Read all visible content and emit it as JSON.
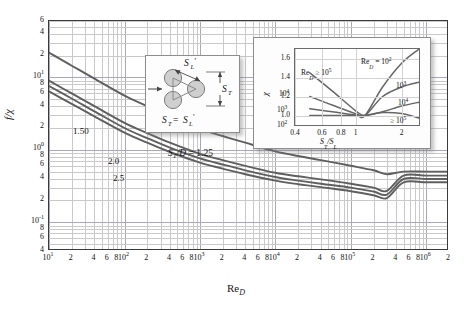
{
  "figure": {
    "y_axis_title": "f/χ",
    "x_axis_title_prefix": "Re",
    "x_axis_title_sub": "D"
  },
  "main_axis": {
    "x_ticks": [
      {
        "label": "10",
        "sup": "1",
        "value": 10
      },
      {
        "label": "2",
        "sup": "",
        "value": 20
      },
      {
        "label": "4",
        "sup": "",
        "value": 40
      },
      {
        "label": "6",
        "sup": "",
        "value": 60
      },
      {
        "label": "8",
        "sup": "",
        "value": 80
      },
      {
        "label": "10",
        "sup": "2",
        "value": 100
      },
      {
        "label": "2",
        "sup": "",
        "value": 200
      },
      {
        "label": "4",
        "sup": "",
        "value": 400
      },
      {
        "label": "6",
        "sup": "",
        "value": 600
      },
      {
        "label": "8",
        "sup": "",
        "value": 800
      },
      {
        "label": "10",
        "sup": "3",
        "value": 1000
      },
      {
        "label": "2",
        "sup": "",
        "value": 2000
      },
      {
        "label": "4",
        "sup": "",
        "value": 4000
      },
      {
        "label": "6",
        "sup": "",
        "value": 6000
      },
      {
        "label": "8",
        "sup": "",
        "value": 8000
      },
      {
        "label": "10",
        "sup": "4",
        "value": 10000
      },
      {
        "label": "2",
        "sup": "",
        "value": 20000
      },
      {
        "label": "4",
        "sup": "",
        "value": 40000
      },
      {
        "label": "6",
        "sup": "",
        "value": 60000
      },
      {
        "label": "8",
        "sup": "",
        "value": 80000
      },
      {
        "label": "10",
        "sup": "5",
        "value": 100000
      },
      {
        "label": "2",
        "sup": "",
        "value": 200000
      },
      {
        "label": "4",
        "sup": "",
        "value": 400000
      },
      {
        "label": "6",
        "sup": "",
        "value": 600000
      },
      {
        "label": "8",
        "sup": "",
        "value": 800000
      },
      {
        "label": "10",
        "sup": "6",
        "value": 1000000
      },
      {
        "label": "2",
        "sup": "",
        "value": 2000000
      }
    ],
    "y_ticks": [
      {
        "label": "6",
        "sup": "",
        "value": 60
      },
      {
        "label": "4",
        "sup": "",
        "value": 40
      },
      {
        "label": "2",
        "sup": "",
        "value": 20
      },
      {
        "label": "10",
        "sup": "1",
        "value": 10
      },
      {
        "label": "8",
        "sup": "",
        "value": 8
      },
      {
        "label": "6",
        "sup": "",
        "value": 6
      },
      {
        "label": "4",
        "sup": "",
        "value": 4
      },
      {
        "label": "2",
        "sup": "",
        "value": 2
      },
      {
        "label": "10",
        "sup": "0",
        "value": 1
      },
      {
        "label": "8",
        "sup": "",
        "value": 0.8
      },
      {
        "label": "6",
        "sup": "",
        "value": 0.6
      },
      {
        "label": "4",
        "sup": "",
        "value": 0.4
      },
      {
        "label": "2",
        "sup": "",
        "value": 0.2
      },
      {
        "label": "10",
        "sup": "-1",
        "value": 0.1
      },
      {
        "label": "8",
        "sup": "",
        "value": 0.08
      },
      {
        "label": "6",
        "sup": "",
        "value": 0.06
      },
      {
        "label": "4",
        "sup": "",
        "value": 0.04
      }
    ]
  },
  "curve_labels": [
    {
      "name": "curve-label-150",
      "text": "1.50",
      "left": 73,
      "top": 126
    },
    {
      "name": "curve-label-20",
      "text": "2.0",
      "left": 108,
      "top": 156
    },
    {
      "name": "curve-label-25",
      "text": "2.5",
      "left": 113,
      "top": 173
    }
  ],
  "ratio_annotation": {
    "name": "st-over-d-annotation",
    "text_html": "S_T/D = 1.25",
    "left": 168,
    "top": 148
  },
  "tube_diagram": {
    "label_sl": "Sₗ'",
    "label_st": "S_T",
    "label_equation": "S_T = S_L'"
  },
  "inset": {
    "y_axis_title": "χ",
    "x_axis_title_prefix": "S",
    "x_axis_title_sub1": "T",
    "x_axis_title_mid": "/S",
    "x_axis_title_sub2": "L",
    "y_ticks": [
      {
        "label": "1.6",
        "value": 1.6
      },
      {
        "label": "1.4",
        "value": 1.4
      },
      {
        "label": "1.2",
        "value": 1.2
      },
      {
        "label": "1.0",
        "value": 1.0
      }
    ],
    "x_ticks": [
      {
        "label": "0.4",
        "value": 0.4
      },
      {
        "label": "0.6",
        "value": 0.6
      },
      {
        "label": "0.8",
        "value": 0.8
      },
      {
        "label": "1",
        "value": 1.0
      },
      {
        "label": "2",
        "value": 2.0
      }
    ],
    "left_labels": [
      {
        "name": "inset-label-re-ge-1e5-left",
        "text": "Re",
        "sub": "D",
        "rest": " ≥ 10",
        "sup": "5",
        "left": 44,
        "top": 20
      },
      {
        "name": "inset-label-1e4-left",
        "text": "10",
        "sub": "",
        "rest": "",
        "sup": "4",
        "left": 22,
        "top": 41
      },
      {
        "name": "inset-label-1e3-left",
        "text": "10",
        "sub": "",
        "rest": "",
        "sup": "3",
        "left": 20,
        "top": 57
      },
      {
        "name": "inset-label-1e2-left",
        "text": "10",
        "sub": "",
        "rest": "",
        "sup": "2",
        "left": 20,
        "top": 72
      }
    ],
    "right_labels": [
      {
        "name": "inset-label-re-1e2-right",
        "text": "Re",
        "sub": "D",
        "rest": " = 10",
        "sup": "2",
        "left": 104,
        "top": 9
      },
      {
        "name": "inset-label-1e3-right",
        "text": "10",
        "sub": "",
        "rest": "",
        "sup": "3",
        "left": 139,
        "top": 33
      },
      {
        "name": "inset-label-1e4-right",
        "text": "10",
        "sub": "",
        "rest": "",
        "sup": "4",
        "left": 141,
        "top": 50
      },
      {
        "name": "inset-label-ge-1e5-right",
        "text": "≥ 10",
        "sub": "",
        "rest": "",
        "sup": "5",
        "left": 133,
        "top": 68
      }
    ]
  },
  "chart_data": {
    "type": "line",
    "xlabel": "Re_D",
    "ylabel": "f/χ",
    "xscale": "log",
    "yscale": "log",
    "xlim": [
      10,
      2000000
    ],
    "ylim": [
      0.04,
      60
    ],
    "grid": true,
    "legend": "inline curve labels",
    "series": [
      {
        "name": "S_T/D = 1.25",
        "label": "1.25",
        "x": [
          10,
          20,
          40,
          100,
          200,
          400,
          1000,
          2000,
          4000,
          10000,
          20000,
          40000,
          100000,
          200000,
          300000,
          500000,
          1000000,
          2000000
        ],
        "y": [
          22,
          14.5,
          9.6,
          5.6,
          4.0,
          2.85,
          1.95,
          1.55,
          1.25,
          0.95,
          0.82,
          0.72,
          0.6,
          0.52,
          0.46,
          0.5,
          0.5,
          0.5
        ]
      },
      {
        "name": "S_T/D = 1.50",
        "label": "1.50",
        "x": [
          10,
          20,
          40,
          100,
          200,
          400,
          1000,
          2000,
          4000,
          10000,
          20000,
          40000,
          100000,
          200000,
          300000,
          500000,
          1000000,
          2000000
        ],
        "y": [
          9.0,
          6.0,
          4.0,
          2.35,
          1.7,
          1.25,
          0.88,
          0.72,
          0.6,
          0.48,
          0.43,
          0.39,
          0.34,
          0.3,
          0.27,
          0.44,
          0.44,
          0.44
        ]
      },
      {
        "name": "S_T/D = 2.0",
        "label": "2.0",
        "x": [
          10,
          20,
          40,
          100,
          200,
          400,
          1000,
          2000,
          4000,
          10000,
          20000,
          40000,
          100000,
          200000,
          300000,
          500000,
          1000000,
          2000000
        ],
        "y": [
          7.6,
          5.1,
          3.4,
          2.0,
          1.45,
          1.07,
          0.76,
          0.625,
          0.52,
          0.42,
          0.375,
          0.34,
          0.3,
          0.265,
          0.24,
          0.395,
          0.395,
          0.395
        ]
      },
      {
        "name": "S_T/D = 2.5",
        "label": "2.5",
        "x": [
          10,
          20,
          40,
          100,
          200,
          400,
          1000,
          2000,
          4000,
          10000,
          20000,
          40000,
          100000,
          200000,
          300000,
          500000,
          1000000,
          2000000
        ],
        "y": [
          6.4,
          4.3,
          2.9,
          1.72,
          1.25,
          0.93,
          0.665,
          0.55,
          0.46,
          0.375,
          0.335,
          0.305,
          0.268,
          0.236,
          0.215,
          0.355,
          0.355,
          0.355
        ]
      }
    ],
    "inset_chart": {
      "type": "line",
      "title": "Correction factor χ",
      "xlabel": "S_T/S_L",
      "ylabel": "χ",
      "xscale": "log",
      "yscale": "linear",
      "xlim": [
        0.4,
        2.6
      ],
      "ylim": [
        0.9,
        1.7
      ],
      "grid": true,
      "series": [
        {
          "name": "Re_D ≥ 10^5",
          "x": [
            0.5,
            0.7,
            1.0,
            1.15,
            1.5,
            2.0,
            2.6
          ],
          "y": [
            1.45,
            1.26,
            1.05,
            1.0,
            1.04,
            1.1,
            1.14
          ]
        },
        {
          "name": "Re_D = 10^4",
          "x": [
            0.5,
            0.7,
            1.0,
            1.15,
            1.5,
            2.0,
            2.6
          ],
          "y": [
            1.2,
            1.11,
            1.02,
            1.0,
            1.2,
            1.3,
            1.35
          ]
        },
        {
          "name": "Re_D = 10^3",
          "x": [
            0.5,
            0.7,
            1.0,
            1.15,
            1.5,
            2.0,
            2.6
          ],
          "y": [
            1.07,
            1.04,
            1.005,
            1.0,
            1.3,
            1.55,
            1.7
          ]
        },
        {
          "name": "Re_D = 10^2",
          "x": [
            0.5,
            0.7,
            1.0,
            1.15,
            1.5,
            2.0,
            2.6
          ],
          "y": [
            1.0,
            1.0,
            1.0,
            1.0,
            1.03,
            1.02,
            0.975
          ]
        }
      ]
    }
  }
}
